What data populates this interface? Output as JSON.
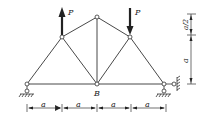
{
  "diagram": {
    "type": "truss",
    "colors": {
      "line": "#333333",
      "node_fill": "#ffffff",
      "background": "#ffffff"
    },
    "nodes": {
      "left_support": {
        "x": 27,
        "y": 84
      },
      "upper_left": {
        "x": 62,
        "y": 37
      },
      "top": {
        "x": 97,
        "y": 17
      },
      "B": {
        "x": 97,
        "y": 84
      },
      "upper_right": {
        "x": 130,
        "y": 37
      },
      "right_support": {
        "x": 164,
        "y": 84
      }
    },
    "labels": {
      "load_left": "P",
      "load_right": "P",
      "node_b": "B",
      "dim_h1": "a",
      "dim_h2": "a",
      "dim_h3": "a",
      "dim_h4": "a",
      "dim_v_top": "a/2",
      "dim_v_bottom": "a"
    },
    "loads": [
      {
        "node": "upper_left",
        "direction": "up",
        "label": "P"
      },
      {
        "node": "upper_right",
        "direction": "down",
        "label": "P"
      }
    ],
    "supports": [
      {
        "node": "left_support",
        "type": "pin"
      },
      {
        "node": "right_support",
        "type": "pin-with-horizontal-link"
      }
    ]
  }
}
